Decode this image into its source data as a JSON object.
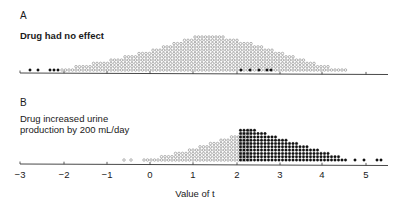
{
  "chart_data": [
    {
      "type": "scatter",
      "subtype": "dot-histogram",
      "panel": "A",
      "title": "Drug had no effect",
      "xlabel": "Value of t",
      "xlim": [
        -3,
        5.5
      ],
      "legend": {
        "open_circle": "t below critical value (not significant)",
        "filled_circle": "t beyond critical value (significant)"
      },
      "baseline_y": 70,
      "axis_y": 73,
      "filled_points_x": [
        30,
        38,
        50,
        54,
        58,
        241,
        250,
        259,
        267,
        271
      ],
      "open_columns": {
        "start_x": 62,
        "pitch": 3.5,
        "heights": [
          1,
          1,
          1,
          1,
          2,
          2,
          2,
          2,
          2,
          3,
          3,
          3,
          3,
          3,
          4,
          4,
          4,
          4,
          5,
          5,
          5,
          5,
          6,
          6,
          6,
          6,
          7,
          7,
          7,
          8,
          8,
          8,
          9,
          9,
          9,
          10,
          10,
          10,
          11,
          11,
          11,
          11,
          11,
          11,
          11,
          11,
          11,
          10,
          10,
          10,
          10,
          9,
          9,
          9,
          9,
          8,
          8,
          8,
          7,
          7,
          7,
          6,
          6,
          6,
          5,
          5,
          5,
          4,
          4,
          4,
          3,
          3,
          3,
          2,
          2,
          2,
          2,
          1,
          1,
          1,
          1,
          1
        ]
      }
    },
    {
      "type": "scatter",
      "subtype": "dot-histogram",
      "panel": "B",
      "title": "Drug increased urine production by 200 mL/day",
      "xlabel": "Value of t",
      "xlim": [
        -3,
        5.5
      ],
      "baseline_y": 160,
      "axis_y": 164,
      "open_singles_x": [
        124,
        131
      ],
      "open_columns": {
        "start_x": 144,
        "pitch": 3.5,
        "heights": [
          1,
          1,
          1,
          1,
          1,
          2,
          2,
          2,
          2,
          3,
          3,
          3,
          3,
          4,
          4,
          4,
          5,
          5,
          5,
          6,
          6,
          6,
          7,
          7,
          7,
          8,
          8,
          8,
          9,
          9,
          10
        ]
      },
      "filled_columns": {
        "start_x": 240.5,
        "pitch": 3.5,
        "heights": [
          10,
          10,
          10,
          10,
          10,
          9,
          9,
          9,
          8,
          8,
          8,
          7,
          7,
          7,
          6,
          6,
          6,
          5,
          5,
          5,
          4,
          4,
          4,
          3,
          3,
          3,
          2,
          2,
          2,
          1,
          1
        ]
      },
      "filled_points_x": [
        355,
        364,
        377,
        381
      ]
    }
  ],
  "panels": {
    "a": {
      "letter": "A",
      "title": "Drug had no effect"
    },
    "b": {
      "letter": "B",
      "title_line1": "Drug increased urine",
      "title_line2": "production by 200 mL/day"
    }
  },
  "axis": {
    "ticks": [
      {
        "label": "−3",
        "x": 20
      },
      {
        "label": "−2",
        "x": 64
      },
      {
        "label": "−1",
        "x": 107
      },
      {
        "label": "0",
        "x": 150
      },
      {
        "label": "1",
        "x": 193
      },
      {
        "label": "2",
        "x": 237
      },
      {
        "label": "3",
        "x": 280
      },
      {
        "label": "4",
        "x": 322
      },
      {
        "label": "5",
        "x": 366
      }
    ],
    "xlabel": "Value of t"
  }
}
